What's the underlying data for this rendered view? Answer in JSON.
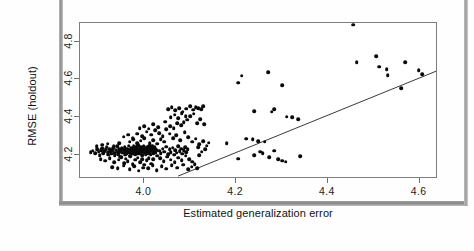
{
  "figure": {
    "kind": "scatter-plot",
    "background": "#ffffff",
    "frame_color": "#7d7d7d",
    "point_color": "#0a0a0a",
    "line_color": "#3a3a3a"
  },
  "chart_data": {
    "type": "scatter",
    "title": "",
    "xlabel": "Estimated generalization error",
    "ylabel": "RMSE (holdout)",
    "xlim": [
      3.86,
      4.64
    ],
    "ylim": [
      4.07,
      4.9
    ],
    "xticks": [
      4.0,
      4.2,
      4.4,
      4.6
    ],
    "xticklabels": [
      "4.0",
      "4.2",
      "4.4",
      "4.6"
    ],
    "yticks": [
      4.2,
      4.4,
      4.6,
      4.8
    ],
    "yticklabels": [
      "4.2",
      "4.4",
      "4.6",
      "4.8"
    ],
    "grid": false,
    "legend": null,
    "reference_line": {
      "kind": "identity",
      "label": "y = x",
      "x0": 4.075,
      "y0": 4.075,
      "x1": 4.64,
      "y1": 4.64
    },
    "series": [
      {
        "name": "models",
        "marker": "filled-circle",
        "color": "#0a0a0a",
        "points": [
          [
            3.883,
            4.213
          ],
          [
            3.888,
            4.221
          ],
          [
            3.893,
            4.208
          ],
          [
            3.897,
            4.229
          ],
          [
            3.901,
            4.216
          ],
          [
            3.903,
            4.198
          ],
          [
            3.906,
            4.224
          ],
          [
            3.909,
            4.234
          ],
          [
            3.911,
            4.206
          ],
          [
            3.913,
            4.219
          ],
          [
            3.916,
            4.227
          ],
          [
            3.918,
            4.241
          ],
          [
            3.92,
            4.212
          ],
          [
            3.922,
            4.2
          ],
          [
            3.924,
            4.231
          ],
          [
            3.926,
            4.218
          ],
          [
            3.928,
            4.205
          ],
          [
            3.93,
            4.223
          ],
          [
            3.932,
            4.236
          ],
          [
            3.934,
            4.211
          ],
          [
            3.936,
            4.196
          ],
          [
            3.938,
            4.226
          ],
          [
            3.94,
            4.215
          ],
          [
            3.941,
            4.243
          ],
          [
            3.943,
            4.203
          ],
          [
            3.945,
            4.23
          ],
          [
            3.946,
            4.218
          ],
          [
            3.948,
            4.189
          ],
          [
            3.949,
            4.221
          ],
          [
            3.951,
            4.234
          ],
          [
            3.952,
            4.209
          ],
          [
            3.954,
            4.225
          ],
          [
            3.955,
            4.213
          ],
          [
            3.957,
            4.24
          ],
          [
            3.958,
            4.199
          ],
          [
            3.959,
            4.228
          ],
          [
            3.961,
            4.216
          ],
          [
            3.962,
            4.206
          ],
          [
            3.963,
            4.232
          ],
          [
            3.965,
            4.22
          ],
          [
            3.966,
            4.248
          ],
          [
            3.967,
            4.21
          ],
          [
            3.968,
            4.226
          ],
          [
            3.97,
            4.194
          ],
          [
            3.971,
            4.237
          ],
          [
            3.972,
            4.217
          ],
          [
            3.973,
            4.229
          ],
          [
            3.974,
            4.205
          ],
          [
            3.976,
            4.222
          ],
          [
            3.977,
            4.244
          ],
          [
            3.978,
            4.212
          ],
          [
            3.979,
            4.233
          ],
          [
            3.98,
            4.201
          ],
          [
            3.981,
            4.225
          ],
          [
            3.982,
            4.218
          ],
          [
            3.983,
            4.239
          ],
          [
            3.984,
            4.208
          ],
          [
            3.985,
            4.229
          ],
          [
            3.986,
            4.215
          ],
          [
            3.987,
            4.25
          ],
          [
            3.988,
            4.222
          ],
          [
            3.989,
            4.204
          ],
          [
            3.99,
            4.235
          ],
          [
            3.991,
            4.219
          ],
          [
            3.992,
            4.211
          ],
          [
            3.993,
            4.241
          ],
          [
            3.994,
            4.226
          ],
          [
            3.995,
            4.197
          ],
          [
            3.996,
            4.231
          ],
          [
            3.997,
            4.216
          ],
          [
            3.998,
            4.223
          ],
          [
            3.999,
            4.246
          ],
          [
            4.0,
            4.209
          ],
          [
            4.001,
            4.234
          ],
          [
            4.002,
            4.22
          ],
          [
            4.003,
            4.202
          ],
          [
            4.004,
            4.228
          ],
          [
            4.005,
            4.214
          ],
          [
            4.006,
            4.238
          ],
          [
            4.007,
            4.224
          ],
          [
            4.008,
            4.207
          ],
          [
            4.009,
            4.23
          ],
          [
            4.01,
            4.218
          ],
          [
            4.011,
            4.243
          ],
          [
            4.012,
            4.212
          ],
          [
            4.013,
            4.226
          ],
          [
            4.014,
            4.2
          ],
          [
            4.015,
            4.233
          ],
          [
            4.016,
            4.221
          ],
          [
            4.017,
            4.248
          ],
          [
            4.018,
            4.215
          ],
          [
            4.019,
            4.236
          ],
          [
            4.02,
            4.206
          ],
          [
            4.021,
            4.229
          ],
          [
            4.022,
            4.219
          ],
          [
            4.023,
            4.24
          ],
          [
            4.024,
            4.21
          ],
          [
            4.025,
            4.232
          ],
          [
            4.026,
            4.223
          ],
          [
            4.028,
            4.195
          ],
          [
            3.905,
            4.176
          ],
          [
            3.915,
            4.168
          ],
          [
            3.925,
            4.182
          ],
          [
            3.935,
            4.16
          ],
          [
            3.944,
            4.173
          ],
          [
            3.95,
            4.186
          ],
          [
            3.956,
            4.155
          ],
          [
            3.96,
            4.178
          ],
          [
            3.964,
            4.166
          ],
          [
            3.969,
            4.19
          ],
          [
            3.975,
            4.15
          ],
          [
            3.98,
            4.172
          ],
          [
            3.986,
            4.184
          ],
          [
            3.991,
            4.158
          ],
          [
            3.996,
            4.176
          ],
          [
            4.0,
            4.145
          ],
          [
            4.005,
            4.169
          ],
          [
            4.01,
            4.181
          ],
          [
            4.015,
            4.152
          ],
          [
            4.02,
            4.174
          ],
          [
            3.93,
            4.134
          ],
          [
            3.942,
            4.128
          ],
          [
            3.955,
            4.14
          ],
          [
            3.968,
            4.122
          ],
          [
            3.978,
            4.137
          ],
          [
            3.988,
            4.115
          ],
          [
            3.998,
            4.131
          ],
          [
            4.008,
            4.126
          ],
          [
            4.018,
            4.142
          ],
          [
            4.027,
            4.118
          ],
          [
            4.032,
            4.22
          ],
          [
            4.036,
            4.208
          ],
          [
            4.04,
            4.232
          ],
          [
            4.044,
            4.216
          ],
          [
            4.048,
            4.241
          ],
          [
            4.052,
            4.203
          ],
          [
            4.055,
            4.228
          ],
          [
            4.058,
            4.214
          ],
          [
            4.062,
            4.236
          ],
          [
            4.065,
            4.199
          ],
          [
            4.068,
            4.224
          ],
          [
            4.071,
            4.21
          ],
          [
            4.074,
            4.245
          ],
          [
            4.077,
            4.218
          ],
          [
            4.08,
            4.231
          ],
          [
            4.083,
            4.205
          ],
          [
            4.086,
            4.222
          ],
          [
            4.089,
            4.24
          ],
          [
            4.092,
            4.213
          ],
          [
            4.095,
            4.228
          ],
          [
            4.035,
            4.18
          ],
          [
            4.042,
            4.165
          ],
          [
            4.05,
            4.189
          ],
          [
            4.058,
            4.172
          ],
          [
            4.066,
            4.158
          ],
          [
            4.074,
            4.184
          ],
          [
            4.082,
            4.169
          ],
          [
            4.09,
            4.193
          ],
          [
            4.098,
            4.176
          ],
          [
            4.104,
            4.162
          ],
          [
            4.038,
            4.138
          ],
          [
            4.048,
            4.125
          ],
          [
            4.06,
            4.143
          ],
          [
            4.072,
            4.13
          ],
          [
            4.085,
            4.147
          ],
          [
            4.096,
            4.121
          ],
          [
            4.103,
            4.135
          ],
          [
            4.11,
            4.15
          ],
          [
            4.115,
            4.128
          ],
          [
            4.12,
            4.198
          ],
          [
            4.012,
            4.262
          ],
          [
            4.02,
            4.275
          ],
          [
            4.028,
            4.258
          ],
          [
            4.036,
            4.283
          ],
          [
            4.043,
            4.268
          ],
          [
            3.968,
            4.268
          ],
          [
            3.976,
            4.281
          ],
          [
            3.984,
            4.259
          ],
          [
            3.992,
            4.274
          ],
          [
            4.0,
            4.288
          ],
          [
            3.955,
            4.295
          ],
          [
            3.965,
            4.305
          ],
          [
            3.975,
            4.29
          ],
          [
            3.985,
            4.312
          ],
          [
            3.995,
            4.298
          ],
          [
            4.005,
            4.322
          ],
          [
            4.015,
            4.306
          ],
          [
            4.024,
            4.33
          ],
          [
            4.032,
            4.314
          ],
          [
            4.04,
            4.298
          ],
          [
            3.99,
            4.34
          ],
          [
            4.0,
            4.352
          ],
          [
            4.01,
            4.338
          ],
          [
            4.02,
            4.36
          ],
          [
            4.03,
            4.345
          ],
          [
            4.048,
            4.335
          ],
          [
            4.056,
            4.352
          ],
          [
            4.064,
            4.341
          ],
          [
            4.072,
            4.368
          ],
          [
            4.08,
            4.356
          ],
          [
            4.058,
            4.398
          ],
          [
            4.066,
            4.412
          ],
          [
            4.074,
            4.392
          ],
          [
            4.082,
            4.42
          ],
          [
            4.09,
            4.404
          ],
          [
            4.052,
            4.44
          ],
          [
            4.06,
            4.452
          ],
          [
            4.068,
            4.436
          ],
          [
            4.076,
            4.448
          ],
          [
            4.084,
            4.428
          ],
          [
            4.092,
            4.444
          ],
          [
            4.1,
            4.456
          ],
          [
            4.106,
            4.438
          ],
          [
            4.112,
            4.452
          ],
          [
            4.118,
            4.448
          ],
          [
            4.124,
            4.442
          ],
          [
            4.128,
            4.456
          ],
          [
            4.115,
            4.368
          ],
          [
            4.122,
            4.388
          ],
          [
            4.13,
            4.362
          ],
          [
            4.1,
            4.404
          ],
          [
            4.108,
            4.418
          ],
          [
            4.094,
            4.386
          ],
          [
            4.086,
            4.372
          ],
          [
            4.046,
            4.374
          ],
          [
            4.055,
            4.312
          ],
          [
            4.063,
            4.288
          ],
          [
            4.07,
            4.302
          ],
          [
            4.078,
            4.276
          ],
          [
            4.088,
            4.318
          ],
          [
            4.096,
            4.292
          ],
          [
            4.104,
            4.268
          ],
          [
            4.112,
            4.284
          ],
          [
            4.12,
            4.256
          ],
          [
            4.128,
            4.272
          ],
          [
            4.136,
            4.248
          ],
          [
            4.14,
            4.264
          ],
          [
            4.133,
            4.23
          ],
          [
            4.125,
            4.216
          ],
          [
            4.118,
            4.238
          ],
          [
            3.896,
            4.245
          ],
          [
            3.908,
            4.252
          ],
          [
            3.92,
            4.258
          ],
          [
            3.933,
            4.244
          ],
          [
            3.946,
            4.262
          ],
          [
            4.205,
            4.582
          ],
          [
            4.212,
            4.62
          ],
          [
            4.24,
            4.432
          ],
          [
            4.27,
            4.638
          ],
          [
            4.278,
            4.428
          ],
          [
            4.283,
            4.442
          ],
          [
            4.3,
            4.57
          ],
          [
            4.31,
            4.402
          ],
          [
            4.322,
            4.398
          ],
          [
            4.336,
            4.388
          ],
          [
            4.205,
            4.178
          ],
          [
            4.252,
            4.216
          ],
          [
            4.258,
            4.206
          ],
          [
            4.272,
            4.186
          ],
          [
            4.283,
            4.22
          ],
          [
            4.292,
            4.176
          ],
          [
            4.3,
            4.168
          ],
          [
            4.308,
            4.162
          ],
          [
            4.34,
            4.192
          ],
          [
            4.24,
            4.198
          ],
          [
            4.455,
            4.89
          ],
          [
            4.463,
            4.692
          ],
          [
            4.505,
            4.722
          ],
          [
            4.512,
            4.668
          ],
          [
            4.528,
            4.655
          ],
          [
            4.53,
            4.622
          ],
          [
            4.56,
            4.552
          ],
          [
            4.568,
            4.69
          ],
          [
            4.598,
            4.648
          ],
          [
            4.606,
            4.628
          ],
          [
            4.222,
            4.285
          ],
          [
            4.236,
            4.282
          ],
          [
            4.248,
            4.272
          ],
          [
            4.262,
            4.268
          ],
          [
            4.18,
            4.262
          ]
        ]
      }
    ]
  }
}
